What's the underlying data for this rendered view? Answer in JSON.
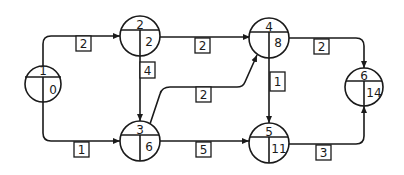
{
  "diagram": {
    "type": "activity-network",
    "nodes": [
      {
        "id": "1",
        "label": "1",
        "value": "0"
      },
      {
        "id": "2",
        "label": "2",
        "value": "2"
      },
      {
        "id": "3",
        "label": "3",
        "value": "6"
      },
      {
        "id": "4",
        "label": "4",
        "value": "8"
      },
      {
        "id": "5",
        "label": "5",
        "value": "11"
      },
      {
        "id": "6",
        "label": "6",
        "value": "14"
      }
    ],
    "edges": [
      {
        "from": "1",
        "to": "2",
        "weight": "2"
      },
      {
        "from": "1",
        "to": "3",
        "weight": "1"
      },
      {
        "from": "2",
        "to": "3",
        "weight": "4"
      },
      {
        "from": "2",
        "to": "4",
        "weight": "2"
      },
      {
        "from": "3",
        "to": "4",
        "weight": "2"
      },
      {
        "from": "3",
        "to": "5",
        "weight": "5"
      },
      {
        "from": "4",
        "to": "5",
        "weight": "1"
      },
      {
        "from": "4",
        "to": "6",
        "weight": "2"
      },
      {
        "from": "5",
        "to": "6",
        "weight": "3"
      }
    ]
  }
}
